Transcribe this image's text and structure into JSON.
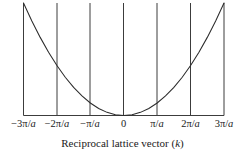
{
  "figure": {
    "axis_title_prefix": "Reciprocal lattice vector (",
    "axis_title_symbol": "k",
    "axis_title_suffix": ")",
    "line_color": "#3c3c3c",
    "curve_color": "#2b2b2b",
    "text_color": "#1a1a1a",
    "background": "#ffffff"
  },
  "chart_data": {
    "type": "line",
    "title": "",
    "xlabel": "Reciprocal lattice vector (k)",
    "ylabel": "",
    "grid": false,
    "legend": "none",
    "xlim": [
      -3,
      3
    ],
    "ylim": [
      0,
      9
    ],
    "axis_units": "π/a",
    "x_tick_values": [
      -3,
      -2,
      -1,
      0,
      1,
      2,
      3
    ],
    "x_tick_labels": [
      "−3π/a",
      "−2π/a",
      "−π/a",
      "0",
      "π/a",
      "2π/a",
      "3π/a"
    ],
    "x_tick_label_parts": [
      {
        "pre": "−3π/",
        "ital": "a"
      },
      {
        "pre": "−2π/",
        "ital": "a"
      },
      {
        "pre": "−π/",
        "ital": "a"
      },
      {
        "pre": "0",
        "ital": ""
      },
      {
        "pre": "π/",
        "ital": "a"
      },
      {
        "pre": "2π/",
        "ital": "a"
      },
      {
        "pre": "3π/",
        "ital": "a"
      }
    ],
    "zone_boundary_x": [
      -3,
      -2,
      -1,
      0,
      1,
      2,
      3
    ],
    "series": [
      {
        "name": "E(k) = ℏ²k²/2m",
        "x": [
          -3.0,
          -2.75,
          -2.5,
          -2.25,
          -2.0,
          -1.75,
          -1.5,
          -1.25,
          -1.0,
          -0.75,
          -0.5,
          -0.25,
          0.0,
          0.25,
          0.5,
          0.75,
          1.0,
          1.25,
          1.5,
          1.75,
          2.0,
          2.25,
          2.5,
          2.75,
          3.0
        ],
        "y": [
          9.0,
          7.5625,
          6.25,
          5.0625,
          4.0,
          3.0625,
          2.25,
          1.5625,
          1.0,
          0.5625,
          0.25,
          0.0625,
          0.0,
          0.0625,
          0.25,
          0.5625,
          1.0,
          1.5625,
          2.25,
          3.0625,
          4.0,
          5.0625,
          6.25,
          7.5625,
          9.0
        ]
      }
    ]
  }
}
